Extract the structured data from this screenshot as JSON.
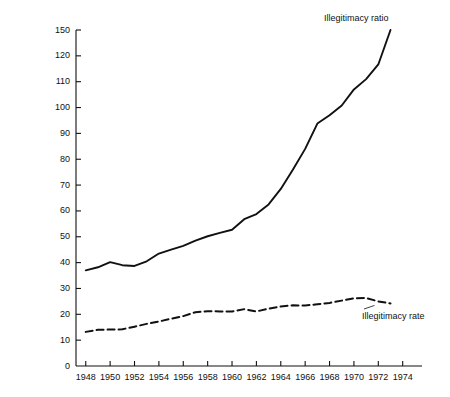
{
  "chart_data": {
    "type": "line",
    "title": "",
    "xlabel": "",
    "ylabel": "Rate per 1000",
    "xlim": [
      1947,
      1975
    ],
    "ylim": [
      0,
      150
    ],
    "grid": false,
    "legend_position": "inline-annotations",
    "x_tick_labels": [
      "1948",
      "1950",
      "1952",
      "1954",
      "1956",
      "1958",
      "1960",
      "1962",
      "1964",
      "1966",
      "1968",
      "1970",
      "1972",
      "1974"
    ],
    "x_tick_values": [
      1948,
      1950,
      1952,
      1954,
      1956,
      1958,
      1960,
      1962,
      1964,
      1966,
      1968,
      1970,
      1972,
      1974
    ],
    "y_tick_labels": [
      "150",
      "120",
      "110",
      "100",
      "90",
      "80",
      "70",
      "60",
      "50",
      "40",
      "30",
      "20",
      "10",
      "0"
    ],
    "y_tick_values": [
      150,
      140,
      110,
      100,
      90,
      80,
      70,
      60,
      50,
      40,
      30,
      20,
      10,
      0
    ],
    "x": [
      1948,
      1949,
      1950,
      1951,
      1952,
      1953,
      1954,
      1955,
      1956,
      1957,
      1958,
      1959,
      1960,
      1961,
      1962,
      1963,
      1964,
      1965,
      1966,
      1967,
      1968,
      1969,
      1970,
      1971,
      1972,
      1973
    ],
    "series": [
      {
        "name": "Illegitimacy ratio",
        "style": "solid",
        "color": "#111111",
        "annotation": "Illegitimacy ratio",
        "values": [
          37.0,
          38.2,
          40.2,
          39.0,
          38.7,
          40.5,
          43.5,
          45.0,
          46.5,
          48.5,
          50.2,
          51.5,
          52.7,
          56.8,
          58.8,
          62.5,
          68.5,
          76.0,
          84.0,
          93.8,
          97.0,
          100.8,
          107.0,
          113.0,
          130.0,
          150.0
        ]
      },
      {
        "name": "Illegitimacy rate",
        "style": "dashed",
        "color": "#111111",
        "annotation": "Illegitimacy rate",
        "values": [
          13.2,
          14.0,
          14.1,
          14.2,
          15.2,
          16.3,
          17.2,
          18.3,
          19.3,
          20.8,
          21.2,
          21.1,
          21.1,
          22.0,
          21.1,
          22.2,
          23.0,
          23.5,
          23.4,
          23.9,
          24.4,
          25.3,
          26.2,
          26.3,
          25.0,
          24.2
        ]
      }
    ]
  },
  "axis": {
    "y_title": "Rate per 1000"
  }
}
